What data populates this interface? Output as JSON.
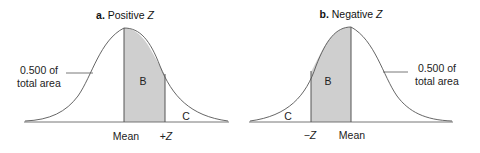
{
  "panels": [
    {
      "id": "a",
      "title_prefix": "a.",
      "title_text": "Positive ",
      "title_var": "Z",
      "region_b": "B",
      "region_c": "C",
      "area_label_line1": "0.500 of",
      "area_label_line2": "total area",
      "x_label_mean": "Mean",
      "x_label_z_sign": "+",
      "x_label_z_var": "Z"
    },
    {
      "id": "b",
      "title_prefix": "b.",
      "title_text": "Negative ",
      "title_var": "Z",
      "region_b": "B",
      "region_c": "C",
      "area_label_line1": "0.500 of",
      "area_label_line2": "total area",
      "x_label_mean": "Mean",
      "x_label_z_sign": "−",
      "x_label_z_var": "Z"
    }
  ],
  "colors": {
    "curve": "#555555",
    "shade": "#cfcfcf",
    "baseline": "#666666"
  }
}
